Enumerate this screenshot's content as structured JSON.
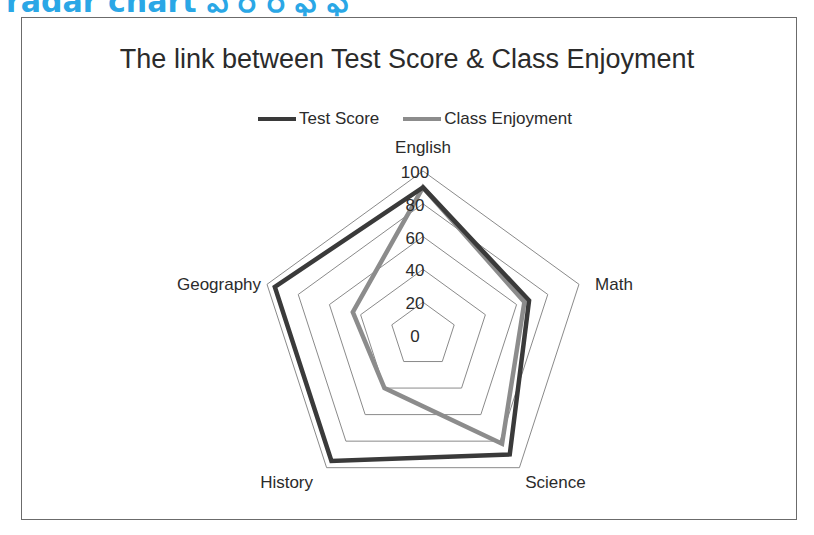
{
  "page_heading": "radar chart ఎ ర ర ఫ ఫ",
  "chart_data": {
    "type": "radar",
    "title": "The link between Test Score & Class Enjoyment",
    "categories": [
      "English",
      "Math",
      "Science",
      "History",
      "Geography"
    ],
    "series": [
      {
        "name": "Test Score",
        "color": "#3a3a3a",
        "values": [
          90,
          68,
          90,
          95,
          95
        ]
      },
      {
        "name": "Class Enjoyment",
        "color": "#8c8c8c",
        "values": [
          90,
          65,
          82,
          40,
          45
        ]
      }
    ],
    "radial_ticks": [
      "0",
      "20",
      "40",
      "60",
      "80",
      "100"
    ],
    "rlim": [
      0,
      100
    ],
    "grid": true,
    "legend_position": "top"
  }
}
